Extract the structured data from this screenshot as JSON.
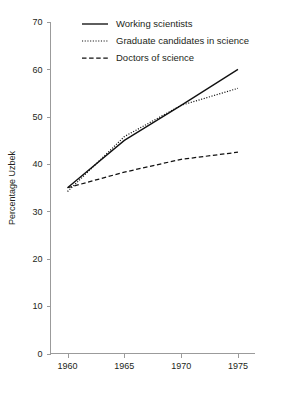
{
  "chart_data": {
    "type": "line",
    "title": "",
    "xlabel": "",
    "ylabel": "Percentage Uzbek",
    "x": [
      1960,
      1965,
      1970,
      1975
    ],
    "xticklabels": [
      "1960",
      "1965",
      "1970",
      "1975"
    ],
    "xlim": [
      1958.5,
      1976.5
    ],
    "ylim": [
      0,
      70
    ],
    "yticks": [
      0,
      10,
      20,
      30,
      40,
      50,
      60,
      70
    ],
    "yticklabels": [
      "0",
      "10",
      "20",
      "30",
      "40",
      "50",
      "60",
      "70"
    ],
    "grid": false,
    "legend_position": "top-center",
    "series": [
      {
        "name": "Working scientists",
        "style": "solid",
        "color": "#111111",
        "values": [
          35.0,
          45.0,
          52.4,
          60.0
        ]
      },
      {
        "name": "Graduate candidates in science",
        "style": "dotted",
        "color": "#111111",
        "values": [
          34.2,
          45.8,
          52.4,
          56.0
        ]
      },
      {
        "name": "Doctors of science",
        "style": "dashed",
        "color": "#111111",
        "values": [
          35.0,
          38.3,
          41.0,
          42.5
        ]
      }
    ]
  },
  "axes": {
    "y_title": "Percentage Uzbek"
  },
  "legend": {
    "items": [
      {
        "label": "Working scientists",
        "style": "solid"
      },
      {
        "label": "Graduate candidates in science",
        "style": "dotted"
      },
      {
        "label": "Doctors of science",
        "style": "dashed"
      }
    ]
  }
}
